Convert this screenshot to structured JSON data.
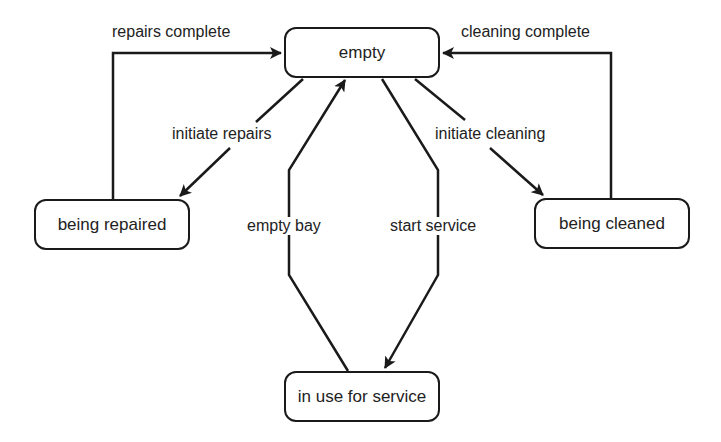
{
  "diagram": {
    "type": "state-diagram",
    "states": [
      {
        "id": "empty",
        "label": "empty"
      },
      {
        "id": "being_repaired",
        "label": "being repaired"
      },
      {
        "id": "being_cleaned",
        "label": "being cleaned"
      },
      {
        "id": "in_use",
        "label": "in use for service"
      }
    ],
    "transitions": [
      {
        "from": "empty",
        "to": "being_repaired",
        "label": "initiate repairs"
      },
      {
        "from": "being_repaired",
        "to": "empty",
        "label": "repairs complete"
      },
      {
        "from": "empty",
        "to": "being_cleaned",
        "label": "initiate cleaning"
      },
      {
        "from": "being_cleaned",
        "to": "empty",
        "label": "cleaning complete"
      },
      {
        "from": "empty",
        "to": "in_use",
        "label": "start service"
      },
      {
        "from": "in_use",
        "to": "empty",
        "label": "empty bay"
      }
    ],
    "colors": {
      "stroke": "#1a1a1a",
      "background": "#ffffff",
      "text": "#222222"
    }
  }
}
